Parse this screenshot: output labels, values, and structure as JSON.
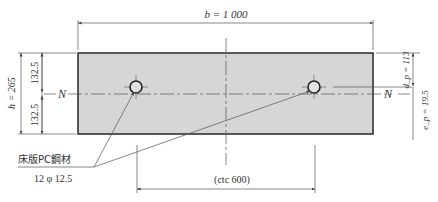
{
  "diagram": {
    "type": "slab-cross-section",
    "colors": {
      "slab_fill": "#d6d6d6",
      "slab_stroke": "#333333",
      "line": "#444444",
      "text": "#333333"
    },
    "width_label": "b = 1 000",
    "height_label": "h = 265",
    "upper_half_label": "132.5",
    "lower_half_label": "132.5",
    "neutral_axis_left": "N",
    "neutral_axis_right": "N",
    "dp_label": "d_p = 113",
    "ep_label": "e_p = 19.5",
    "tendon_label_line1": "床版PC鋼材",
    "tendon_label_line2": "12 φ 12.5",
    "spacing_label": "(ctc 600)"
  }
}
